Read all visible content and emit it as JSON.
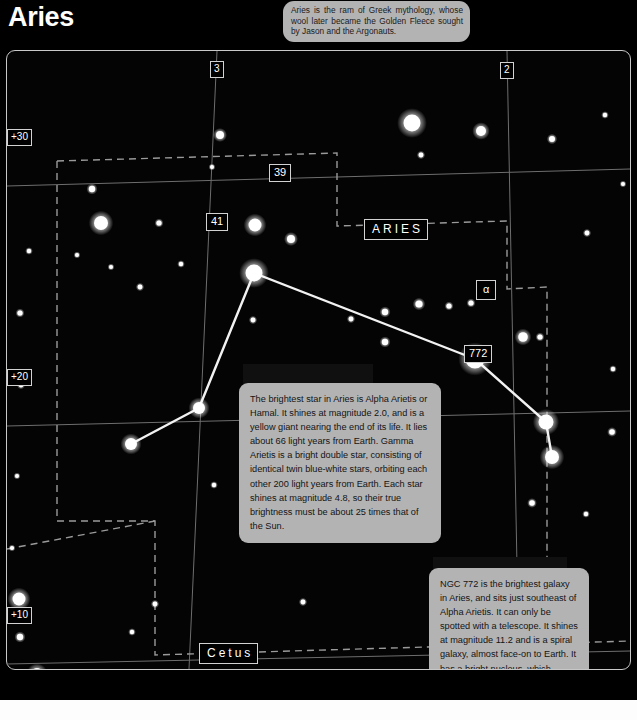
{
  "header": {
    "title": "Aries"
  },
  "mythology_callout": {
    "text": "Aries is the ram of Greek mythology, whose wool later became the Golden Fleece sought by Jason and the Argonauts."
  },
  "chart_data": {
    "type": "scatter",
    "title": "Aries",
    "xlabel": "Right Ascension (hours)",
    "ylabel": "Declination (degrees)",
    "grid": true,
    "legend": null,
    "constellation_labels": [
      {
        "id": "aries",
        "text": "ARIES",
        "x": 362,
        "y": 221
      },
      {
        "id": "cetus",
        "text": "Cetus",
        "x": 197,
        "y": 644
      }
    ],
    "coordinate_labels": [
      {
        "id": "ra-3",
        "text": "3",
        "x": 203,
        "y": 60,
        "axis": "ra"
      },
      {
        "id": "ra-2",
        "text": "2",
        "x": 493,
        "y": 61,
        "axis": "ra"
      },
      {
        "id": "dec-30",
        "text": "+30",
        "x": 6,
        "y": 128,
        "axis": "dec"
      },
      {
        "id": "dec-20",
        "text": "+20",
        "x": 6,
        "y": 368,
        "axis": "dec"
      },
      {
        "id": "dec-10",
        "text": "+10",
        "x": 6,
        "y": 606,
        "axis": "dec"
      }
    ],
    "star_labels": [
      {
        "id": "star-39",
        "text": "39",
        "x": 267,
        "y": 164
      },
      {
        "id": "star-41",
        "text": "41",
        "x": 204,
        "y": 213
      },
      {
        "id": "star-alpha",
        "text": "α",
        "x": 474,
        "y": 280
      },
      {
        "id": "ngc-772",
        "text": "772",
        "x": 462,
        "y": 345
      }
    ],
    "stars": [
      {
        "x": 405,
        "y": 72,
        "r": 8.5
      },
      {
        "x": 213,
        "y": 84,
        "r": 4.0
      },
      {
        "x": 474,
        "y": 80,
        "r": 5.0
      },
      {
        "x": 545,
        "y": 88,
        "r": 3.0
      },
      {
        "x": 598,
        "y": 64,
        "r": 2.2
      },
      {
        "x": 414,
        "y": 104,
        "r": 2.4
      },
      {
        "x": 85,
        "y": 138,
        "r": 3.2
      },
      {
        "x": 205,
        "y": 116,
        "r": 2.0
      },
      {
        "x": 616,
        "y": 133,
        "r": 2.0
      },
      {
        "x": 94,
        "y": 172,
        "r": 7.0
      },
      {
        "x": 152,
        "y": 172,
        "r": 2.6
      },
      {
        "x": 22,
        "y": 200,
        "r": 2.2
      },
      {
        "x": 70,
        "y": 204,
        "r": 2.0
      },
      {
        "x": 104,
        "y": 216,
        "r": 2.0
      },
      {
        "x": 174,
        "y": 213,
        "r": 2.2
      },
      {
        "x": 248,
        "y": 174,
        "r": 6.5
      },
      {
        "x": 284,
        "y": 188,
        "r": 4.0
      },
      {
        "x": 580,
        "y": 182,
        "r": 2.4
      },
      {
        "x": 13,
        "y": 262,
        "r": 2.6
      },
      {
        "x": 133,
        "y": 236,
        "r": 2.4
      },
      {
        "x": 247,
        "y": 222,
        "r": 8.5,
        "bright": true
      },
      {
        "x": 246,
        "y": 269,
        "r": 2.4
      },
      {
        "x": 344,
        "y": 268,
        "r": 2.4
      },
      {
        "x": 378,
        "y": 261,
        "r": 3.2
      },
      {
        "x": 412,
        "y": 253,
        "r": 3.6
      },
      {
        "x": 442,
        "y": 255,
        "r": 2.6
      },
      {
        "x": 464,
        "y": 252,
        "r": 2.6
      },
      {
        "x": 378,
        "y": 291,
        "r": 3.2
      },
      {
        "x": 516,
        "y": 286,
        "r": 4.8
      },
      {
        "x": 533,
        "y": 286,
        "r": 2.6
      },
      {
        "x": 468,
        "y": 308,
        "r": 9.5,
        "bright": true
      },
      {
        "x": 14,
        "y": 334,
        "r": 2.4
      },
      {
        "x": 606,
        "y": 318,
        "r": 2.2
      },
      {
        "x": 192,
        "y": 357,
        "r": 6.0,
        "bright": true
      },
      {
        "x": 124,
        "y": 393,
        "r": 6.0,
        "bright": true
      },
      {
        "x": 539,
        "y": 371,
        "r": 7.5,
        "bright": true
      },
      {
        "x": 545,
        "y": 406,
        "r": 7.0,
        "bright": true
      },
      {
        "x": 605,
        "y": 381,
        "r": 2.8
      },
      {
        "x": 10,
        "y": 425,
        "r": 2.0
      },
      {
        "x": 207,
        "y": 434,
        "r": 2.2
      },
      {
        "x": 525,
        "y": 452,
        "r": 2.8
      },
      {
        "x": 579,
        "y": 463,
        "r": 2.2
      },
      {
        "x": 5,
        "y": 497,
        "r": 2.0
      },
      {
        "x": 12,
        "y": 548,
        "r": 6.5,
        "bright": true
      },
      {
        "x": 148,
        "y": 553,
        "r": 2.4
      },
      {
        "x": 125,
        "y": 581,
        "r": 2.2
      },
      {
        "x": 13,
        "y": 586,
        "r": 3.2
      },
      {
        "x": 30,
        "y": 623,
        "r": 6.0,
        "bright": true
      },
      {
        "x": 41,
        "y": 645,
        "r": 6.5,
        "bright": true
      },
      {
        "x": 186,
        "y": 658,
        "r": 5.5
      },
      {
        "x": 254,
        "y": 637,
        "r": 5.0
      },
      {
        "x": 364,
        "y": 672,
        "r": 5.5
      },
      {
        "x": 455,
        "y": 663,
        "r": 5.0
      },
      {
        "x": 466,
        "y": 671,
        "r": 2.6
      },
      {
        "x": 378,
        "y": 622,
        "r": 2.0
      },
      {
        "x": 296,
        "y": 551,
        "r": 2.4
      }
    ],
    "constellation_lines": [
      {
        "from": [
          124,
          393
        ],
        "to": [
          192,
          357
        ]
      },
      {
        "from": [
          192,
          357
        ],
        "to": [
          247,
          222
        ]
      },
      {
        "from": [
          247,
          222
        ],
        "to": [
          468,
          308
        ]
      },
      {
        "from": [
          468,
          308
        ],
        "to": [
          539,
          371
        ]
      },
      {
        "from": [
          539,
          371
        ],
        "to": [
          545,
          406
        ]
      }
    ],
    "ra_gridlines": [
      {
        "label": "3",
        "x_top": 210,
        "x_bottom": 182
      },
      {
        "label": "2",
        "x_top": 500,
        "x_bottom": 512
      }
    ],
    "dec_gridlines": [
      {
        "label": "+30",
        "y_left": 135,
        "y_right": 118
      },
      {
        "label": "+20",
        "y_left": 375,
        "y_right": 360
      },
      {
        "label": "+10",
        "y_left": 613,
        "y_right": 600
      }
    ],
    "boundary_style": "dashed"
  },
  "info_boxes": [
    {
      "id": "alpha-arietis",
      "text": "The brightest star in Aries is Alpha Arietis or Hamal. It shines at magnitude 2.0, and is a yellow giant nearing the end of its life. It lies about 66 light years from Earth. Gamma Arietis is a bright double star, consisting of identical twin blue-white stars, orbiting each other 200 light years from Earth. Each star shines at magnitude 4.8, so their true brightness must be about 25 times that of the Sun."
    },
    {
      "id": "ngc-772",
      "text": "NGC 772 is the brightest galaxy in Aries, and sits just southeast of Alpha Arietis. It can only be spotted with a telescope. It shines at magnitude 11.2 and is a spiral galaxy, almost face-on to Earth. It has a bright nucleus, which makes it relatively easy to spot with a good telescope."
    }
  ],
  "colors": {
    "background": "#000000",
    "star": "#ffffff",
    "grid": "#6e6e6e",
    "boundary": "#9a9a9a",
    "constellation_line": "#f2f2f2",
    "callout_bg": "#b3b3b3",
    "callout_text": "#141414",
    "label_border": "#d2d2d2",
    "title_text": "#ffffff"
  }
}
